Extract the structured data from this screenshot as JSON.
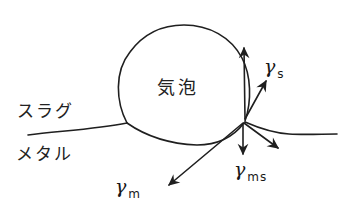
{
  "diagram": {
    "labels": {
      "bubble": "気泡",
      "slag": "スラグ",
      "metal": "メタル"
    },
    "vectors": {
      "gamma_s": {
        "symbol": "γ",
        "subscript": "s"
      },
      "gamma_m": {
        "symbol": "γ",
        "subscript": "m"
      },
      "gamma_ms": {
        "symbol": "γ",
        "subscript": "ms"
      }
    },
    "colors": {
      "ink": "#1f1f1f",
      "background": "#ffffff"
    }
  }
}
